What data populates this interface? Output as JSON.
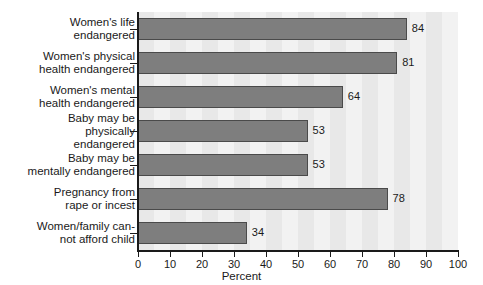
{
  "chart_data": {
    "type": "bar",
    "orientation": "horizontal",
    "title": "",
    "xlabel": "Percent",
    "ylabel": "",
    "xlim": [
      0,
      100
    ],
    "xticks": [
      0,
      10,
      20,
      30,
      40,
      50,
      60,
      70,
      80,
      90,
      100
    ],
    "grid": false,
    "legend": null,
    "categories": [
      "Women's life\nendangered",
      "Women's physical\nhealth endangered",
      "Women's mental\nhealth endangered",
      "Baby may be\nphysically\nendangered",
      "Baby may be\nmentally endangered",
      "Pregnancy from\nrape or incest",
      "Women/family can-\nnot afford child"
    ],
    "values": [
      84,
      81,
      64,
      53,
      53,
      78,
      34
    ],
    "value_labels": [
      "84",
      "81",
      "64",
      "53",
      "53",
      "78",
      "34"
    ],
    "colors": {
      "bar_fill": "#7e7e7e",
      "bar_edge": "#4a4a4a",
      "plot_background": "#f2f2f2",
      "plot_stripe": "#e8e8e8",
      "axis": "#1a1a1a",
      "text": "#1a1a1a",
      "page_background": "#ffffff"
    }
  }
}
